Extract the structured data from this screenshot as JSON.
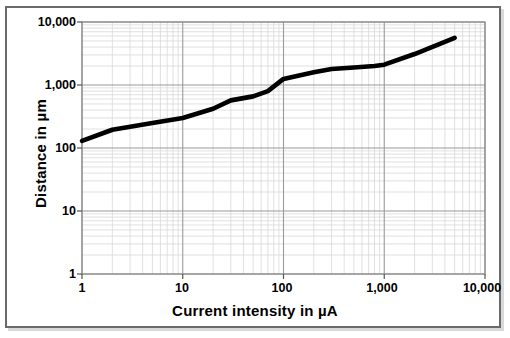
{
  "figure": {
    "background_color": "#ffffff",
    "frame_color": "#6a6a6a",
    "series_color": "#000000",
    "grid_major_color": "#9a9a9a",
    "grid_minor_color": "#d8d8d8"
  },
  "chart_data": {
    "type": "line",
    "title": "",
    "xlabel": "Current intensity in µA",
    "ylabel": "Distance in µm",
    "xscale": "log",
    "yscale": "log",
    "xlim": [
      1,
      10000
    ],
    "ylim": [
      1,
      10000
    ],
    "grid": true,
    "legend": "none",
    "xticks": [
      1,
      10,
      100,
      1000,
      10000
    ],
    "xticklabels": [
      "1",
      "10",
      "100",
      "1,000",
      "10,000"
    ],
    "yticks": [
      1,
      10,
      100,
      1000,
      10000
    ],
    "yticklabels": [
      "1",
      "10",
      "100",
      "1,000",
      "10,000"
    ],
    "series": [
      {
        "name": "Distance vs current intensity",
        "x": [
          1,
          2,
          5,
          10,
          20,
          30,
          50,
          70,
          100,
          200,
          300,
          500,
          800,
          1000,
          2000,
          5000
        ],
        "y": [
          130,
          195,
          250,
          300,
          420,
          570,
          660,
          800,
          1250,
          1600,
          1800,
          1900,
          2000,
          2100,
          3100,
          5600
        ]
      }
    ]
  }
}
